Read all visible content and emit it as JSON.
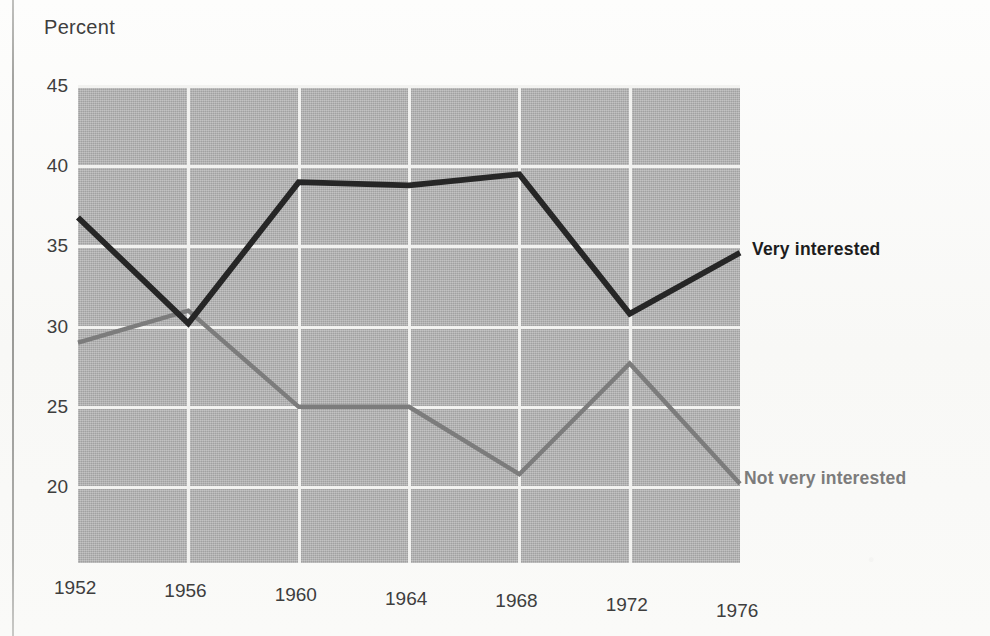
{
  "chart_data": {
    "type": "line",
    "title": "",
    "xlabel": "",
    "ylabel": "Percent",
    "x": [
      1952,
      1956,
      1960,
      1964,
      1968,
      1972,
      1976
    ],
    "categories": [
      "1952",
      "1956",
      "1960",
      "1964",
      "1968",
      "1972",
      "1976"
    ],
    "xlim": [
      1952,
      1976
    ],
    "ylim": [
      18.5,
      45
    ],
    "yticks": [
      45,
      40,
      35,
      30,
      25,
      20
    ],
    "ytick_labels": [
      "45",
      "40",
      "35",
      "30",
      "25",
      "20"
    ],
    "grid": true,
    "legend_position": "right-inline-labels",
    "series": [
      {
        "name": "Very interested",
        "color": "#262626",
        "values": [
          36.8,
          30.2,
          39.0,
          38.8,
          39.5,
          30.8,
          34.6
        ]
      },
      {
        "name": "Not very interested",
        "color": "#7c7c7c",
        "values": [
          29.0,
          31.0,
          25.0,
          25.0,
          20.8,
          27.7,
          20.2
        ]
      }
    ],
    "annotations": [
      {
        "text": "Very interested",
        "series": "Very interested"
      },
      {
        "text": "Not very interested",
        "series": "Not very interested"
      }
    ]
  },
  "axis": {
    "ylabel": "Percent"
  },
  "legend": {
    "very_interested": "Very interested",
    "not_very_interested": "Not very interested"
  },
  "colors": {
    "very_interested": "#262626",
    "not_very_interested": "#7c7c7c",
    "plot_background": "#b2b2b2",
    "gridline": "#f2f2f0",
    "page_background": "#fbfbf9",
    "text": "#3e3e3e"
  }
}
